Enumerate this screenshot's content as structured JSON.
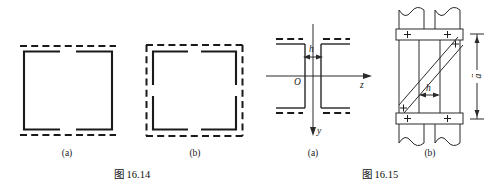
{
  "figures": [
    {
      "id": "fig-16-14",
      "title": "图 16.14",
      "panels": [
        {
          "key": "a",
          "label": "(a)",
          "description": "square frame with solid members and dashed top and bottom deformation outline"
        },
        {
          "key": "b",
          "label": "(b)",
          "description": "square frame with fully dashed outline and solid corner brackets"
        }
      ]
    },
    {
      "id": "fig-16-15",
      "title": "图 16.15",
      "panels": [
        {
          "key": "a",
          "label": "(a)",
          "description": "I-beam cross section with z and y coordinate axes and web thickness h"
        },
        {
          "key": "b",
          "label": "(b)",
          "description": "riveted plate connection with diagonal brace, spacing h and height a"
        }
      ]
    }
  ],
  "fig_16_15_a": {
    "axis_z": "z",
    "axis_y": "y",
    "origin": "O",
    "dimension_h": "h"
  },
  "fig_16_15_b": {
    "dimension_h": "h",
    "dimension_a": "a",
    "rivet_symbol": "+",
    "rivet_count": 4
  },
  "colors": {
    "ink": "#1a1a1a",
    "paper": "#ffffff"
  }
}
